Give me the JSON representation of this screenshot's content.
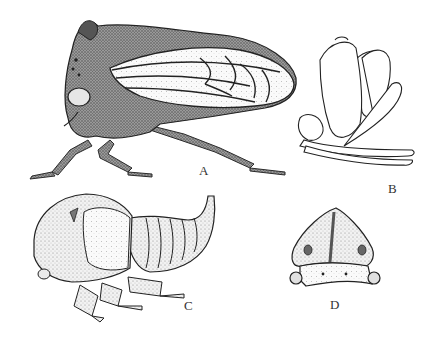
{
  "figure": {
    "panels": [
      {
        "id": "A",
        "label": "A",
        "subject": "adult treehopper, lateral view"
      },
      {
        "id": "B",
        "label": "B",
        "subject": "outline drawing, lateral view"
      },
      {
        "id": "C",
        "label": "C",
        "subject": "nymph, lateral view"
      },
      {
        "id": "D",
        "label": "D",
        "subject": "head and pronotum, frontal view"
      }
    ],
    "colors": {
      "ink": "#2a2a2a",
      "shade_dark": "#555555",
      "shade_mid": "#8a8a8a",
      "shade_light": "#d0d0d0",
      "paper": "#ffffff"
    }
  }
}
